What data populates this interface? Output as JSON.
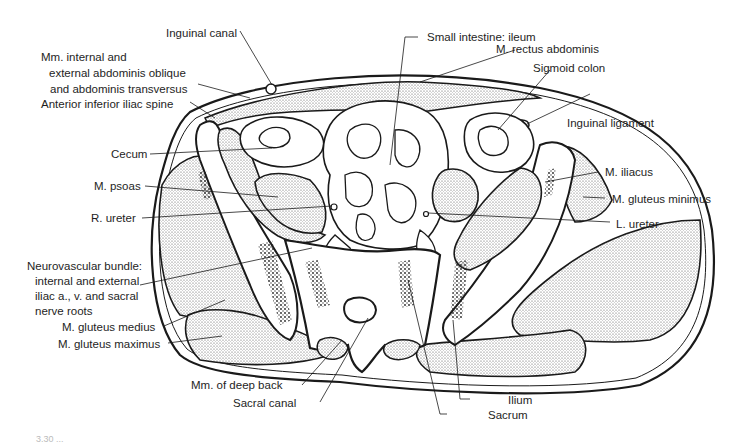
{
  "figure": {
    "caption_partial": "3.30 ..."
  },
  "labels": {
    "inguinal_canal": "Inguinal canal",
    "abd_obliques_l1": "Mm. internal and",
    "abd_obliques_l2": "external abdominis oblique",
    "abd_obliques_l3": "and abdominis transversus",
    "ant_inf_iliac_spine": "Anterior inferior iliac spine",
    "cecum": "Cecum",
    "psoas": "M. psoas",
    "r_ureter": "R. ureter",
    "neurovascular_l1": "Neurovascular bundle:",
    "neurovascular_l2": "internal and external",
    "neurovascular_l3": "iliac a., v. and sacral",
    "neurovascular_l4": "nerve roots",
    "gluteus_medius": "M. gluteus medius",
    "gluteus_maximus": "M. gluteus maximus",
    "deep_back": "Mm. of deep back",
    "sacral_canal": "Sacral canal",
    "small_intestine": "Small intestine: ileum",
    "rectus_abdominis": "M. rectus abdominis",
    "sigmoid_colon": "Sigmoid colon",
    "inguinal_ligament": "Inguinal ligament",
    "iliacus": "M. iliacus",
    "gluteus_minimus": "M. gluteus minimus",
    "l_ureter": "L. ureter",
    "ilium": "Ilium",
    "sacrum": "Sacrum"
  },
  "colors": {
    "ink": "#1a1a1a",
    "stipple": "#cfcfcf",
    "background": "#ffffff"
  }
}
